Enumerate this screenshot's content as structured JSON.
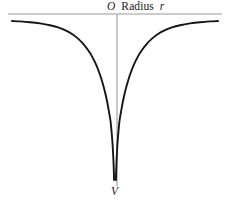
{
  "figure": {
    "background_color": "#ffffff",
    "curve_color": "#151515",
    "axis_color": "#9a9a9a",
    "text_color": "#1a1a1a"
  },
  "labels": {
    "origin": "O",
    "horizontal_axis_name": "Radius",
    "horizontal_axis_symbol": "r",
    "vertex": "V"
  },
  "chart_data": {
    "type": "line",
    "title": "",
    "xlabel": "Radius  r",
    "ylabel": "V",
    "grid": false,
    "legend": null,
    "axis_lines": {
      "horizontal": {
        "x_start": 8,
        "x_end": 222,
        "y": 14,
        "color": "#9a9a9a"
      },
      "vertical": {
        "x": 117,
        "y_start": 14,
        "y_end": 186,
        "color": "#9a9a9a"
      }
    },
    "xlim": [
      -110,
      110
    ],
    "ylim": [
      -170,
      8
    ],
    "annotations": [
      {
        "text": "O",
        "x": 110,
        "y": 10,
        "style": "italic"
      },
      {
        "text": "Radius",
        "x": 126,
        "y": 10,
        "style": "roman"
      },
      {
        "text": "r",
        "x": 163,
        "y": 10,
        "style": "italic"
      },
      {
        "text": "V",
        "x": 113,
        "y": 192,
        "style": "italic"
      }
    ],
    "series": [
      {
        "name": "left-branch",
        "comment": "Asymptotic 1/r style potential well, left side",
        "x": [
          12,
          20,
          30,
          40,
          50,
          58,
          66,
          72,
          78,
          83,
          88,
          92,
          96,
          99,
          102,
          105,
          107,
          109,
          110.5,
          111.5,
          112.5,
          113,
          113.5,
          113.8,
          114,
          114,
          114
        ],
        "y": [
          21,
          21.4,
          22.2,
          23.4,
          25.2,
          27.4,
          30.6,
          34,
          38.6,
          43.6,
          50,
          56.4,
          64.4,
          72,
          81,
          92,
          101,
          112,
          121,
          131,
          143,
          152,
          162,
          170,
          176,
          179,
          180
        ]
      },
      {
        "name": "right-branch",
        "comment": "Asymptotic 1/r style potential well, right side",
        "x": [
          218,
          210,
          200,
          190,
          180,
          172,
          164,
          158,
          152,
          147,
          142,
          138,
          134,
          131,
          128,
          125,
          123,
          121,
          119.5,
          118.5,
          117.5,
          117,
          116.5,
          116.2,
          116,
          116,
          116
        ],
        "y": [
          21,
          21.4,
          22.2,
          23.4,
          25.2,
          27.4,
          30.6,
          34,
          38.6,
          43.6,
          50,
          56.4,
          64.4,
          72,
          81,
          92,
          101,
          112,
          121,
          131,
          143,
          152,
          162,
          170,
          176,
          179,
          180
        ]
      }
    ]
  }
}
